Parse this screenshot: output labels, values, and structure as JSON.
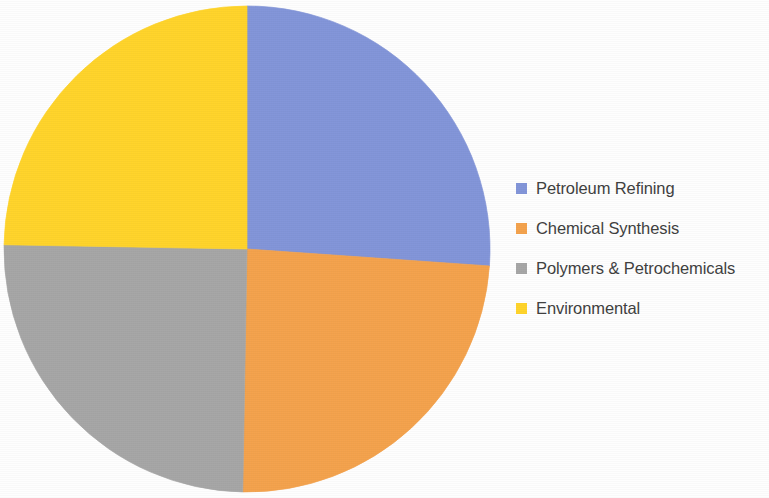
{
  "background_color": "#FEFEFE",
  "chart_data": {
    "type": "pie",
    "title": "",
    "labels": [
      "Petroleum Refining",
      "Chemical Synthesis",
      "Polymers & Petrochemicals",
      "Environmental"
    ],
    "values": [
      26,
      24,
      25,
      25
    ],
    "colors": [
      "#8295D9",
      "#F4A24C",
      "#A6A6A6",
      "#FFD42A"
    ],
    "start_angle_deg": 0,
    "direction": "clockwise",
    "slice_angles_deg": [
      94,
      87,
      90,
      89
    ],
    "legend": {
      "position": "right",
      "entries": [
        {
          "label": "Petroleum Refining",
          "color": "#8295D9",
          "swatch": "legend-swatch-blue"
        },
        {
          "label": "Chemical Synthesis",
          "color": "#F4A24C",
          "swatch": "legend-swatch-orange"
        },
        {
          "label": "Polymers & Petrochemicals",
          "color": "#A6A6A6",
          "swatch": "legend-swatch-gray"
        },
        {
          "label": "Environmental",
          "color": "#FFD42A",
          "swatch": "legend-swatch-yellow"
        }
      ]
    },
    "grid": false,
    "xlabel": "",
    "ylabel": "",
    "data_labels_shown": false,
    "geometry": {
      "center_x": 247,
      "center_y": 249,
      "radius": 243
    }
  }
}
